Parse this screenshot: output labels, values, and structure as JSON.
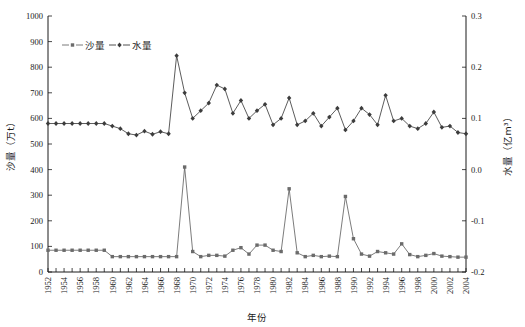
{
  "chart_data": {
    "type": "line",
    "title": "",
    "xlabel": "年份",
    "ylabel": "沙量（万t）",
    "y2label": "水量（亿m³）",
    "grid": false,
    "legend_position": "top-left",
    "xlim": [
      1952,
      2004
    ],
    "ylim": [
      0,
      1000
    ],
    "y2lim": [
      -0.2,
      0.3
    ],
    "yticks": [
      0,
      100,
      200,
      300,
      400,
      500,
      600,
      700,
      800,
      900,
      1000
    ],
    "ytick_labels": [
      "0",
      "100",
      "200",
      "300",
      "400",
      "500",
      "600",
      "700",
      "800",
      "900",
      "1000"
    ],
    "y2ticks": [
      -0.2,
      -0.1,
      0.0,
      0.1,
      0.2,
      0.3
    ],
    "y2tick_labels": [
      "-0.2",
      "-0.1",
      "0.0",
      "0.1",
      "0.2",
      "0.3"
    ],
    "xticks": [
      1952,
      1954,
      1956,
      1958,
      1960,
      1962,
      1964,
      1966,
      1968,
      1970,
      1972,
      1974,
      1976,
      1978,
      1980,
      1982,
      1984,
      1986,
      1988,
      1990,
      1992,
      1994,
      1996,
      1998,
      2000,
      2002,
      2004
    ],
    "xtick_labels": [
      "1952",
      "1954",
      "1956",
      "1958",
      "1960",
      "1962",
      "1964",
      "1966",
      "1968",
      "1970",
      "1972",
      "1974",
      "1976",
      "1978",
      "1980",
      "1982",
      "1984",
      "1986",
      "1988",
      "1990",
      "1992",
      "1994",
      "1996",
      "1998",
      "2000",
      "2002",
      "2004"
    ],
    "x": [
      1952,
      1953,
      1954,
      1955,
      1956,
      1957,
      1958,
      1959,
      1960,
      1961,
      1962,
      1963,
      1964,
      1965,
      1966,
      1967,
      1968,
      1969,
      1970,
      1971,
      1972,
      1973,
      1974,
      1975,
      1976,
      1977,
      1978,
      1979,
      1980,
      1981,
      1982,
      1983,
      1984,
      1985,
      1986,
      1987,
      1988,
      1989,
      1990,
      1991,
      1992,
      1993,
      1994,
      1995,
      1996,
      1997,
      1998,
      1999,
      2000,
      2001,
      2002,
      2003,
      2004
    ],
    "series": [
      {
        "name": "沙量",
        "axis": "left",
        "unit": "万t",
        "marker": "square",
        "color": "#6b6b6b",
        "values": [
          85,
          85,
          85,
          85,
          85,
          85,
          85,
          85,
          60,
          60,
          60,
          60,
          60,
          60,
          60,
          60,
          60,
          410,
          80,
          60,
          65,
          65,
          62,
          85,
          95,
          70,
          105,
          105,
          85,
          80,
          325,
          75,
          60,
          65,
          60,
          62,
          60,
          295,
          130,
          70,
          62,
          80,
          75,
          70,
          110,
          68,
          60,
          65,
          72,
          62,
          60,
          58,
          58
        ]
      },
      {
        "name": "水量",
        "axis": "right",
        "unit": "亿m³",
        "marker": "diamond",
        "color": "#3c3c3c",
        "values_left_scale": [
          580,
          580,
          580,
          580,
          580,
          580,
          580,
          580,
          570,
          560,
          540,
          535,
          550,
          538,
          548,
          540,
          845,
          700,
          600,
          630,
          660,
          730,
          715,
          620,
          670,
          600,
          630,
          655,
          575,
          600,
          680,
          575,
          590,
          620,
          570,
          605,
          640,
          555,
          590,
          640,
          615,
          575,
          690,
          590,
          600,
          570,
          560,
          580,
          625,
          565,
          570,
          545,
          540
        ],
        "values": [
          0.09,
          0.09,
          0.09,
          0.09,
          0.09,
          0.09,
          0.09,
          0.09,
          0.087,
          0.084,
          0.078,
          0.076,
          0.08,
          0.077,
          0.079,
          0.078,
          0.1735,
          0.14,
          0.11,
          0.119,
          0.128,
          0.149,
          0.1445,
          0.116,
          0.131,
          0.11,
          0.119,
          0.1265,
          0.0925,
          0.1,
          0.134,
          0.0925,
          0.097,
          0.106,
          0.091,
          0.1015,
          0.112,
          0.0865,
          0.097,
          0.112,
          0.1045,
          0.0925,
          0.142,
          0.097,
          0.1,
          0.091,
          0.088,
          0.094,
          0.1075,
          0.0895,
          0.091,
          0.0835,
          0.082
        ]
      }
    ]
  },
  "legend": {
    "items": [
      {
        "label": "沙量",
        "marker": "square"
      },
      {
        "label": "水量",
        "marker": "diamond"
      }
    ]
  }
}
